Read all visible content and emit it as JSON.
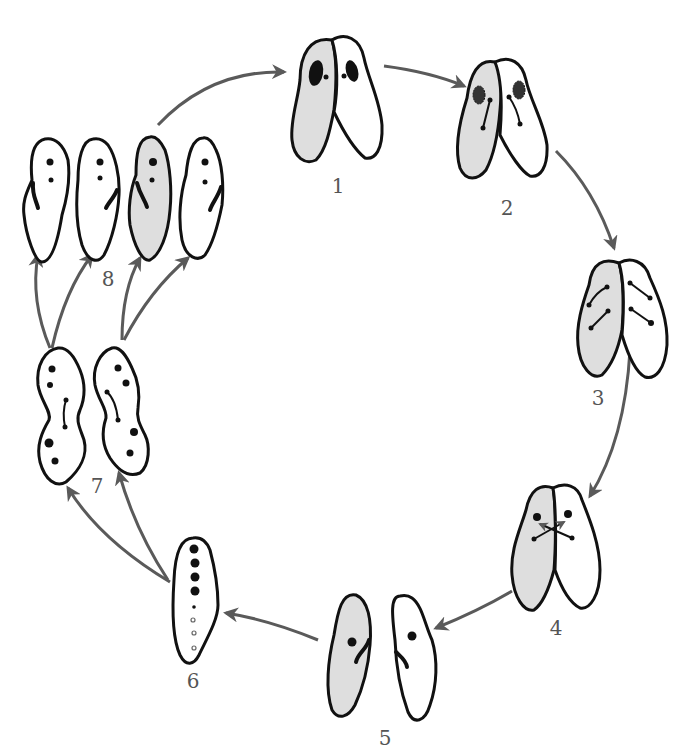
{
  "diagram": {
    "colors": {
      "outline": "#111111",
      "shaded_cell": "#dedede",
      "unshaded_cell": "#ffffff",
      "arrow": "#5a5a5a",
      "label": "#555555"
    },
    "stages": [
      {
        "id": 1,
        "label": "1",
        "description": "Two paramecia paired, each with macronucleus and micronucleus"
      },
      {
        "id": 2,
        "label": "2",
        "description": "Macronuclei disintegrating, micronuclei dividing"
      },
      {
        "id": 3,
        "label": "3",
        "description": "Micronuclei undergo meiosis"
      },
      {
        "id": 4,
        "label": "4",
        "description": "Exchange of micronuclei between cells"
      },
      {
        "id": 5,
        "label": "5",
        "description": "Cells separate, each with fused micronucleus"
      },
      {
        "id": 6,
        "label": "6",
        "description": "Micronuclei divide; eight nuclei formed"
      },
      {
        "id": 7,
        "label": "7",
        "description": "Cells divide"
      },
      {
        "id": 8,
        "label": "8",
        "description": "Four daughter cells from each exconjugant"
      }
    ],
    "arrows": [
      {
        "from": "8",
        "to": "1"
      },
      {
        "from": "1",
        "to": "2"
      },
      {
        "from": "2",
        "to": "3"
      },
      {
        "from": "3",
        "to": "4"
      },
      {
        "from": "4",
        "to": "5"
      },
      {
        "from": "5",
        "to": "6"
      },
      {
        "from": "6",
        "to": "7"
      },
      {
        "from": "7",
        "to": "8"
      }
    ]
  }
}
